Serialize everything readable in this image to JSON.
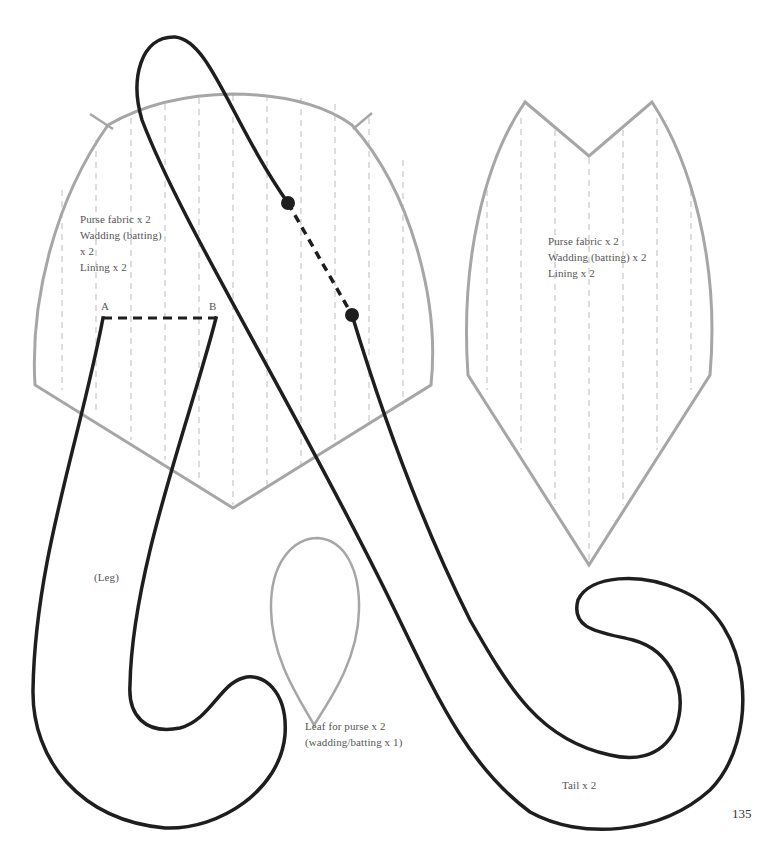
{
  "page": {
    "number": "135"
  },
  "colors": {
    "cut_line_gray": "#a6a6a6",
    "guide_line_gray": "#bdbdbd",
    "outline_black": "#1e1e1e",
    "text_gray": "#555555"
  },
  "pieces": {
    "purse_back": {
      "label_lines": [
        "Purse fabric x 2",
        "Wadding (batting)",
        "x 2",
        "Lining x 2"
      ]
    },
    "purse_front": {
      "label_lines": [
        "Purse fabric x 2",
        "Wadding (batting) x 2",
        "Lining x 2"
      ]
    },
    "leg": {
      "label": "(Leg)",
      "point_a": "A",
      "point_b": "B"
    },
    "leaf": {
      "label_lines": [
        "Leaf for purse x 2",
        "(wadding/batting x 1)"
      ]
    },
    "tail": {
      "label": "Tail x 2"
    }
  }
}
